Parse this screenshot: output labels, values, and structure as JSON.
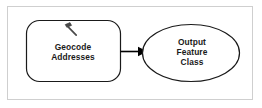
{
  "diagram": {
    "background_color": "#ffffff",
    "frame_color": "#cfcfcf",
    "stroke_color": "#1a1a1a",
    "text_color": "#1a1a1a",
    "nodes": [
      {
        "id": "geocode-addresses",
        "type": "tool",
        "shape": "rounded-rectangle",
        "label": "Geocode\nAddresses",
        "icon": "hammer-icon",
        "fill": "#ffffff",
        "stroke": "#1a1a1a",
        "x": 26,
        "y": 20,
        "width": 94,
        "height": 62
      },
      {
        "id": "output-feature-class",
        "type": "data",
        "shape": "ellipse",
        "label": "Output\nFeature\nClass",
        "fill": "#ffffff",
        "stroke": "#1a1a1a",
        "x": 142,
        "y": 24,
        "width": 98,
        "height": 58
      }
    ],
    "connectors": [
      {
        "id": "geocode-to-output",
        "from": "geocode-addresses",
        "to": "output-feature-class",
        "style": "solid",
        "arrowhead": "filled-triangle",
        "color": "#000000"
      }
    ]
  }
}
